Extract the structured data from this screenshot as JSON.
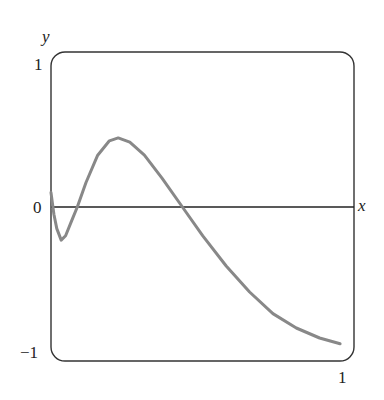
{
  "chart_data": {
    "type": "line",
    "title": "",
    "xlabel": "x",
    "ylabel": "y",
    "xlim": [
      0,
      1
    ],
    "ylim": [
      -1,
      1
    ],
    "x_ticks": [
      "0",
      "1"
    ],
    "y_ticks": [
      "1",
      "0",
      "-1"
    ],
    "grid": false,
    "legend": null,
    "series": [
      {
        "name": "curve",
        "color": "#888888",
        "x": [
          0.0,
          0.01,
          0.02,
          0.035,
          0.05,
          0.07,
          0.09,
          0.12,
          0.16,
          0.2,
          0.23,
          0.27,
          0.32,
          0.38,
          0.45,
          0.52,
          0.6,
          0.68,
          0.76,
          0.84,
          0.92,
          0.99
        ],
        "y": [
          0.1,
          -0.05,
          -0.15,
          -0.23,
          -0.2,
          -0.1,
          0.0,
          0.17,
          0.36,
          0.46,
          0.48,
          0.45,
          0.36,
          0.2,
          0.0,
          -0.2,
          -0.41,
          -0.59,
          -0.74,
          -0.84,
          -0.91,
          -0.95
        ]
      }
    ]
  },
  "labels": {
    "y_axis": "y",
    "x_axis": "x",
    "y_top": "1",
    "y_zero": "0",
    "y_bottom": "−1",
    "x_right": "1"
  }
}
